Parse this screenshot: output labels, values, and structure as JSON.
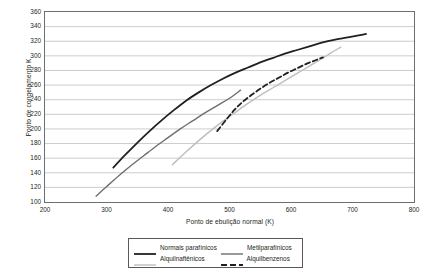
{
  "chart_data": {
    "type": "line",
    "title": "",
    "xlabel": "Ponto de ebulição normal (K)",
    "ylabel": "Ponto de congelamento K",
    "xlim": [
      200,
      800
    ],
    "ylim": [
      100,
      360
    ],
    "xticks": [
      200,
      300,
      400,
      500,
      600,
      700,
      800
    ],
    "yticks": [
      100,
      120,
      140,
      160,
      180,
      200,
      220,
      240,
      260,
      280,
      300,
      320,
      340,
      360
    ],
    "grid": "horizontal",
    "legend_position": "below",
    "series": [
      {
        "name": "Normais parafínicos",
        "color": "#231f20",
        "style": "solid",
        "width": 1.8,
        "points": [
          [
            311,
            147
          ],
          [
            330,
            164
          ],
          [
            350,
            181
          ],
          [
            370,
            197
          ],
          [
            390,
            212
          ],
          [
            410,
            226
          ],
          [
            430,
            239
          ],
          [
            450,
            250
          ],
          [
            470,
            260
          ],
          [
            490,
            269
          ],
          [
            510,
            277
          ],
          [
            530,
            284
          ],
          [
            550,
            291
          ],
          [
            570,
            297
          ],
          [
            590,
            303
          ],
          [
            610,
            308
          ],
          [
            630,
            313
          ],
          [
            650,
            318
          ],
          [
            670,
            322
          ],
          [
            690,
            325
          ],
          [
            710,
            328
          ],
          [
            722,
            330
          ]
        ]
      },
      {
        "name": "Metilparafínicos",
        "color": "#6d6e71",
        "style": "solid",
        "width": 1.4,
        "points": [
          [
            283,
            108
          ],
          [
            300,
            121
          ],
          [
            320,
            136
          ],
          [
            340,
            150
          ],
          [
            360,
            163
          ],
          [
            380,
            176
          ],
          [
            400,
            188
          ],
          [
            420,
            200
          ],
          [
            440,
            211
          ],
          [
            460,
            222
          ],
          [
            480,
            232
          ],
          [
            500,
            242
          ],
          [
            518,
            253
          ]
        ]
      },
      {
        "name": "Alquilnaftênicos",
        "color": "#bcbec0",
        "style": "solid",
        "width": 1.4,
        "points": [
          [
            407,
            151
          ],
          [
            430,
            169
          ],
          [
            450,
            184
          ],
          [
            470,
            198
          ],
          [
            490,
            211
          ],
          [
            510,
            223
          ],
          [
            530,
            235
          ],
          [
            550,
            246
          ],
          [
            570,
            256
          ],
          [
            590,
            266
          ],
          [
            610,
            276
          ],
          [
            630,
            286
          ],
          [
            650,
            296
          ],
          [
            665,
            304
          ],
          [
            681,
            312
          ]
        ]
      },
      {
        "name": "Alquilbenzenos",
        "color": "#231f20",
        "style": "dashed",
        "width": 1.8,
        "points": [
          [
            480,
            197
          ],
          [
            495,
            213
          ],
          [
            508,
            226
          ],
          [
            520,
            236
          ],
          [
            535,
            246
          ],
          [
            550,
            255
          ],
          [
            565,
            263
          ],
          [
            580,
            270
          ],
          [
            595,
            277
          ],
          [
            610,
            283
          ],
          [
            625,
            289
          ],
          [
            640,
            294
          ],
          [
            652,
            298
          ]
        ]
      }
    ]
  },
  "legend": {
    "items": [
      {
        "label": "Normais parafínicos",
        "color": "#231f20",
        "style": "solid",
        "width": 1.8
      },
      {
        "label": "Metilparafínicos",
        "color": "#6d6e71",
        "style": "solid",
        "width": 1.4
      },
      {
        "label": "Alquilnaftênicos",
        "color": "#bcbec0",
        "style": "solid",
        "width": 1.4
      },
      {
        "label": "Alquilbenzenos",
        "color": "#231f20",
        "style": "dashed",
        "width": 1.8
      }
    ]
  }
}
